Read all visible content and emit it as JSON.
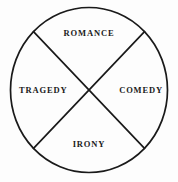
{
  "diagram": {
    "type": "circle-quadrant-wheel",
    "shape": {
      "outline": "circle",
      "divider": "diagonal-cross",
      "segments": 4
    },
    "style": {
      "background_color": "#fdfdfd",
      "stroke_color": "#1a1a1a",
      "text_color": "#1a1a1a",
      "stroke_width": "1.6"
    },
    "labels": {
      "top": "ROMANCE",
      "left": "TRAGEDY",
      "right": "COMEDY",
      "bottom": "IRONY"
    },
    "geometry": {
      "center_x": 89,
      "center_y": 90,
      "radius_x": 79,
      "radius_y": 83,
      "diagonal_angle_degrees": 45
    }
  }
}
